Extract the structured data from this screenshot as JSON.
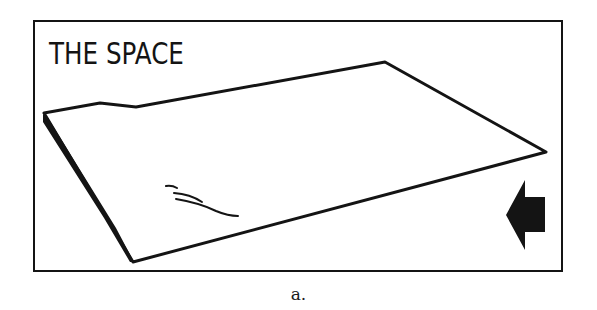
{
  "figure": {
    "title": "THE SPACE",
    "caption": "a.",
    "elements": {
      "sheet": "tilted-plane-icon",
      "arrow": "arrow-left-icon",
      "marks": "squiggle-marks"
    },
    "colors": {
      "ink": "#141414",
      "background": "#ffffff"
    }
  }
}
